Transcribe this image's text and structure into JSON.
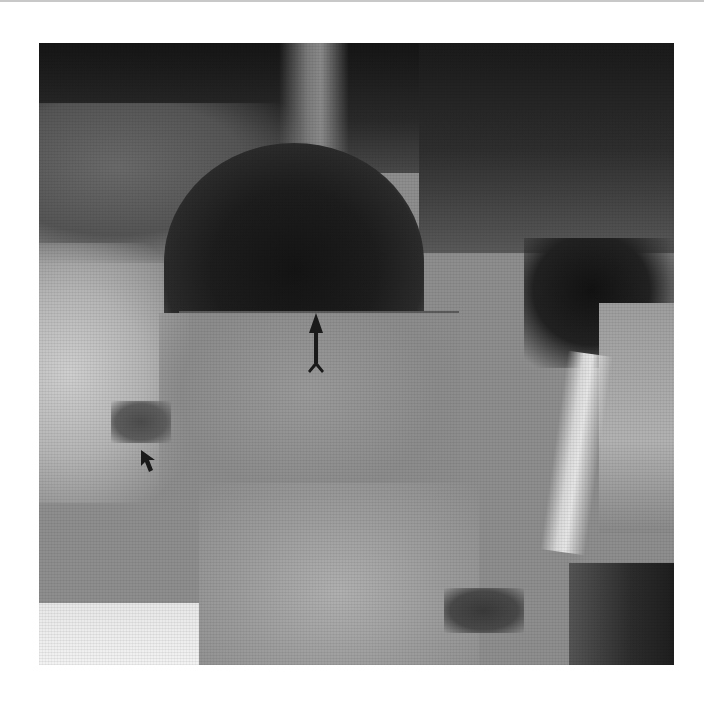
{
  "figure": {
    "type": "radiograph",
    "annotations": [
      {
        "name": "vertical-arrow",
        "direction": "up",
        "color": "#1a1a1a"
      },
      {
        "name": "small-arrow",
        "direction": "up-left",
        "color": "#1a1a1a"
      }
    ]
  },
  "colors": {
    "background": "#ffffff",
    "top_rule": "#c8c8c8",
    "darkest": "#141414",
    "mid_grey": "#8e8e8e",
    "brightest": "#f2f2f2"
  }
}
